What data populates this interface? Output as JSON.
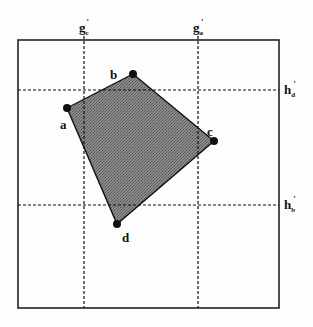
{
  "diagram": {
    "frame": {
      "x": 18,
      "y": 40,
      "width": 261,
      "height": 268,
      "stroke": "#222222"
    },
    "fill_color": "#7a7a7a",
    "vertices": [
      {
        "id": "a",
        "label": "a",
        "x": 67,
        "y": 108,
        "label_x": 60,
        "label_y": 129
      },
      {
        "id": "b",
        "label": "b",
        "x": 133,
        "y": 74,
        "label_x": 110,
        "label_y": 79
      },
      {
        "id": "c",
        "label": "c",
        "x": 214,
        "y": 141,
        "label_x": 207,
        "label_y": 136
      },
      {
        "id": "d",
        "label": "d",
        "x": 117,
        "y": 224,
        "label_x": 122,
        "label_y": 242
      }
    ],
    "vertical_lines": [
      {
        "id": "g_c",
        "x": 84,
        "main": "g",
        "sub": "c",
        "prime": "'"
      },
      {
        "id": "g_a",
        "x": 198,
        "main": "g",
        "sub": "a",
        "prime": "'"
      }
    ],
    "horizontal_lines": [
      {
        "id": "h_d",
        "y": 90,
        "main": "h",
        "sub": "d",
        "prime": "'"
      },
      {
        "id": "h_b",
        "y": 205,
        "main": "h",
        "sub": "b",
        "prime": "'"
      }
    ]
  }
}
